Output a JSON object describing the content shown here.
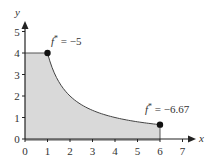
{
  "chart_data": {
    "type": "area",
    "title": "",
    "xlabel": "x",
    "ylabel": "y",
    "xlim": [
      0,
      7
    ],
    "ylim": [
      0,
      5
    ],
    "x_ticks": [
      "0",
      "1",
      "2",
      "3",
      "4",
      "5",
      "6",
      "7"
    ],
    "y_ticks": [
      "0",
      "1",
      "2",
      "3",
      "4",
      "5"
    ],
    "grid": false,
    "legend": null,
    "region": {
      "description": "Shaded feasible region bounded by y=4 for 0<=x<=1, curve y=4/x for 1<=x<=6, x=6, and the axes",
      "boundary": [
        {
          "x": 0,
          "y": 0
        },
        {
          "x": 0,
          "y": 4
        },
        {
          "x": 1,
          "y": 4
        },
        {
          "x": 2,
          "y": 2
        },
        {
          "x": 3,
          "y": 1.333
        },
        {
          "x": 4,
          "y": 1
        },
        {
          "x": 5,
          "y": 0.8
        },
        {
          "x": 6,
          "y": 0.667
        },
        {
          "x": 6,
          "y": 0
        }
      ],
      "fill_color": "#d9d9d9"
    },
    "points": [
      {
        "x": 1,
        "y": 4,
        "label": "f* = −5"
      },
      {
        "x": 6,
        "y": 0.667,
        "label": "f* = −6.67"
      }
    ],
    "annotations": [
      {
        "text_main": "f",
        "text_sup": "*",
        "text_rest": " = −5",
        "x": 1,
        "y": 4
      },
      {
        "text_main": "f",
        "text_sup": "*",
        "text_rest": " = −6.67",
        "x": 6,
        "y": 0.667
      }
    ]
  },
  "colors": {
    "axis": "#222222",
    "curve": "#444444",
    "fill": "#d9d9d9",
    "point": "#111111",
    "text": "#333333"
  }
}
